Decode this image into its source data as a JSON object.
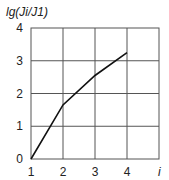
{
  "chart_data": {
    "type": "line",
    "title": "",
    "ylabel_parts": {
      "a": "lg(",
      "b": "Ji",
      "c": "/",
      "d": "J",
      "e": "1)"
    },
    "ylabel": "lg(Ji/J1)",
    "xlabel": "i",
    "xlim": [
      1,
      5
    ],
    "ylim": [
      0,
      4
    ],
    "grid": true,
    "x_ticks": [
      1,
      2,
      3,
      4
    ],
    "x_tick_labels": [
      "1",
      "2",
      "3",
      "4"
    ],
    "y_ticks": [
      0,
      1,
      2,
      3,
      4
    ],
    "y_tick_labels": [
      "0",
      "1",
      "2",
      "3",
      "4"
    ],
    "series": [
      {
        "name": "lg(Ji/J1)",
        "x": [
          1,
          2,
          3,
          4
        ],
        "values": [
          0,
          1.65,
          2.55,
          3.25
        ]
      }
    ]
  }
}
